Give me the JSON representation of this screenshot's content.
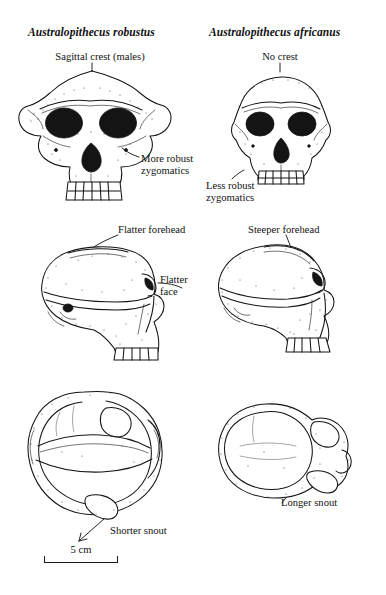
{
  "figure": {
    "kind": "comparative-anatomy-plate",
    "columns": [
      {
        "id": "robustus",
        "title": "Australopithecus robustus",
        "annotations": {
          "crest": "Sagittal crest (males)",
          "zygomatics": "More robust\nzygomatics",
          "forehead": "Flatter forehead",
          "face": "Flatter\nface",
          "snout": "Shorter snout"
        }
      },
      {
        "id": "africanus",
        "title": "Australopithecus africanus",
        "annotations": {
          "crest": "No crest",
          "zygomatics": "Less robust\nzygomatics",
          "forehead": "Steeper forehead",
          "snout": "Longer snout"
        }
      }
    ],
    "rows": [
      {
        "id": "frontal-view",
        "label": "frontal view of cranium"
      },
      {
        "id": "lateral-view",
        "label": "lateral view of cranium"
      },
      {
        "id": "superior-view",
        "label": "superior view of cranium"
      }
    ],
    "scale": {
      "value": "5 cm",
      "length_px": 74
    },
    "colors": {
      "ink": "#151515",
      "paper": "#ffffff",
      "shadow": "#141414"
    }
  }
}
